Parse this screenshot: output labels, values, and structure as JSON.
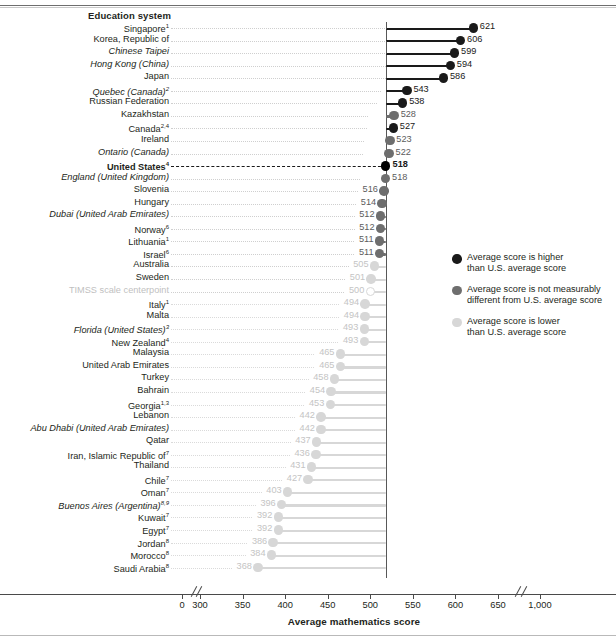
{
  "header": {
    "column_title": "Education system"
  },
  "axis": {
    "title": "Average mathematics score",
    "ticks": [
      "0",
      "300",
      "350",
      "400",
      "450",
      "500",
      "550",
      "600",
      "650",
      "1,000"
    ],
    "has_break_low": true,
    "has_break_high": true
  },
  "legend": {
    "items": [
      {
        "color": "#1a1a1a",
        "label": "Average score is higher\nthan U.S. average score"
      },
      {
        "color": "#6e6e6e",
        "label": "Average score is not measurably\ndifferent from U.S. average score"
      },
      {
        "color": "#d7d7d7",
        "label": "Average score is lower\nthan U.S. average score"
      }
    ]
  },
  "colors": {
    "higher": "#1a1a1a",
    "same": "#6e6e6e",
    "lower": "#d7d7d7",
    "us": "#000000",
    "centerpoint": "#cfcfcf"
  },
  "chart_data": {
    "type": "bar",
    "title": "",
    "xlabel": "Average mathematics score",
    "ylabel": "Education system",
    "xlim": [
      300,
      650
    ],
    "grid": false,
    "reference_line": {
      "value": 518,
      "label": "United States"
    },
    "categories": [
      "Singapore1",
      "Korea, Republic of",
      "Chinese Taipei",
      "Hong Kong (China)",
      "Japan",
      "Quebec (Canada)2",
      "Russian Federation",
      "Kazakhstan",
      "Canada2,4",
      "Ireland",
      "Ontario (Canada)",
      "United States4",
      "England (United Kingdom)",
      "Slovenia",
      "Hungary",
      "Dubai (United Arab Emirates)",
      "Norway6",
      "Lithuania1",
      "Israel6",
      "Australia",
      "Sweden",
      "TIMSS scale centerpoint",
      "Italy1",
      "Malta",
      "Florida (United States)3",
      "New Zealand4",
      "Malaysia",
      "United Arab Emirates",
      "Turkey",
      "Bahrain",
      "Georgia1,3",
      "Lebanon",
      "Abu Dhabi (United Arab Emirates)",
      "Qatar",
      "Iran, Islamic Republic of7",
      "Thailand",
      "Chile7",
      "Oman7",
      "Buenos Aires (Argentina)8,9",
      "Kuwait7",
      "Egypt7",
      "Jordan8",
      "Morocco8",
      "Saudi Arabia8"
    ],
    "values": [
      621,
      606,
      599,
      594,
      586,
      543,
      538,
      528,
      527,
      523,
      522,
      518,
      518,
      516,
      514,
      512,
      512,
      511,
      511,
      505,
      501,
      500,
      494,
      494,
      493,
      493,
      465,
      465,
      458,
      454,
      453,
      442,
      442,
      437,
      436,
      431,
      427,
      403,
      396,
      392,
      392,
      386,
      384,
      368
    ],
    "rows": [
      {
        "label": "Education system",
        "is_header": true
      },
      {
        "label": "Singapore",
        "sup": "1",
        "value": 621,
        "status": "higher",
        "italic": false
      },
      {
        "label": "Korea, Republic of",
        "sup": "",
        "value": 606,
        "status": "higher",
        "italic": false
      },
      {
        "label": "Chinese Taipei",
        "sup": "",
        "value": 599,
        "status": "higher",
        "italic": true
      },
      {
        "label": "Hong Kong (China)",
        "sup": "",
        "value": 594,
        "status": "higher",
        "italic": true
      },
      {
        "label": "Japan",
        "sup": "",
        "value": 586,
        "status": "higher",
        "italic": false
      },
      {
        "label": "Quebec (Canada)",
        "sup": "2",
        "value": 543,
        "status": "higher",
        "italic": true
      },
      {
        "label": "Russian Federation",
        "sup": "",
        "value": 538,
        "status": "higher",
        "italic": false
      },
      {
        "label": "Kazakhstan",
        "sup": "",
        "value": 528,
        "status": "same",
        "italic": false
      },
      {
        "label": "Canada",
        "sup": "2,4",
        "value": 527,
        "status": "higher",
        "italic": false
      },
      {
        "label": "Ireland",
        "sup": "",
        "value": 523,
        "status": "same",
        "italic": false
      },
      {
        "label": "Ontario (Canada)",
        "sup": "",
        "value": 522,
        "status": "same",
        "italic": true
      },
      {
        "label": "United States",
        "sup": "4",
        "value": 518,
        "status": "us",
        "italic": false,
        "bold": true
      },
      {
        "label": "England (United Kingdom)",
        "sup": "",
        "value": 518,
        "status": "same",
        "italic": true
      },
      {
        "label": "Slovenia",
        "sup": "",
        "value": 516,
        "status": "same",
        "italic": false
      },
      {
        "label": "Hungary",
        "sup": "",
        "value": 514,
        "status": "same",
        "italic": false
      },
      {
        "label": "Dubai (United Arab Emirates)",
        "sup": "",
        "value": 512,
        "status": "same",
        "italic": true
      },
      {
        "label": "Norway",
        "sup": "6",
        "value": 512,
        "status": "same",
        "italic": false
      },
      {
        "label": "Lithuania",
        "sup": "1",
        "value": 511,
        "status": "same",
        "italic": false
      },
      {
        "label": "Israel",
        "sup": "6",
        "value": 511,
        "status": "same",
        "italic": false
      },
      {
        "label": "Australia",
        "sup": "",
        "value": 505,
        "status": "lower",
        "italic": false
      },
      {
        "label": "Sweden",
        "sup": "",
        "value": 501,
        "status": "lower",
        "italic": false
      },
      {
        "label": "TIMSS scale centerpoint",
        "sup": "",
        "value": 500,
        "status": "centerpoint",
        "italic": false,
        "faint": true
      },
      {
        "label": "Italy",
        "sup": "1",
        "value": 494,
        "status": "lower",
        "italic": false
      },
      {
        "label": "Malta",
        "sup": "",
        "value": 494,
        "status": "lower",
        "italic": false
      },
      {
        "label": "Florida (United States)",
        "sup": "3",
        "value": 493,
        "status": "lower",
        "italic": true
      },
      {
        "label": "New Zealand",
        "sup": "4",
        "value": 493,
        "status": "lower",
        "italic": false
      },
      {
        "label": "Malaysia",
        "sup": "",
        "value": 465,
        "status": "lower",
        "italic": false
      },
      {
        "label": "United Arab Emirates",
        "sup": "",
        "value": 465,
        "status": "lower",
        "italic": false
      },
      {
        "label": "Turkey",
        "sup": "",
        "value": 458,
        "status": "lower",
        "italic": false
      },
      {
        "label": "Bahrain",
        "sup": "",
        "value": 454,
        "status": "lower",
        "italic": false
      },
      {
        "label": "Georgia",
        "sup": "1,3",
        "value": 453,
        "status": "lower",
        "italic": false
      },
      {
        "label": "Lebanon",
        "sup": "",
        "value": 442,
        "status": "lower",
        "italic": false
      },
      {
        "label": "Abu Dhabi (United Arab Emirates)",
        "sup": "",
        "value": 442,
        "status": "lower",
        "italic": true
      },
      {
        "label": "Qatar",
        "sup": "",
        "value": 437,
        "status": "lower",
        "italic": false
      },
      {
        "label": "Iran, Islamic Republic of",
        "sup": "7",
        "value": 436,
        "status": "lower",
        "italic": false
      },
      {
        "label": "Thailand",
        "sup": "",
        "value": 431,
        "status": "lower",
        "italic": false
      },
      {
        "label": "Chile",
        "sup": "7",
        "value": 427,
        "status": "lower",
        "italic": false
      },
      {
        "label": "Oman",
        "sup": "7",
        "value": 403,
        "status": "lower",
        "italic": false
      },
      {
        "label": "Buenos Aires (Argentina)",
        "sup": "8,9",
        "value": 396,
        "status": "lower",
        "italic": true
      },
      {
        "label": "Kuwait",
        "sup": "7",
        "value": 392,
        "status": "lower",
        "italic": false
      },
      {
        "label": "Egypt",
        "sup": "7",
        "value": 392,
        "status": "lower",
        "italic": false
      },
      {
        "label": "Jordan",
        "sup": "8",
        "value": 386,
        "status": "lower",
        "italic": false
      },
      {
        "label": "Morocco",
        "sup": "8",
        "value": 384,
        "status": "lower",
        "italic": false
      },
      {
        "label": "Saudi Arabia",
        "sup": "8",
        "value": 368,
        "status": "lower",
        "italic": false
      }
    ]
  }
}
